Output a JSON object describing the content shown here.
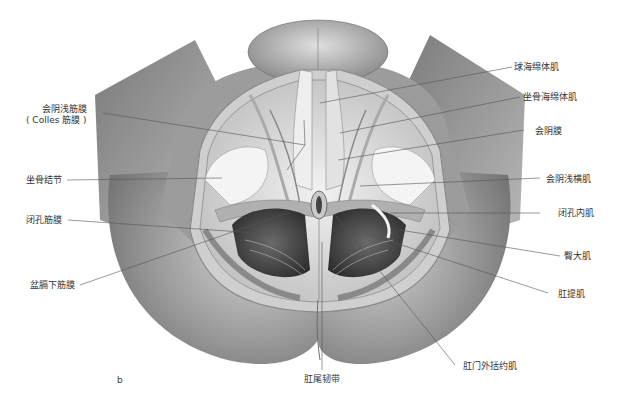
{
  "figure": {
    "panel_letter": "b"
  },
  "labels_left": [
    {
      "id": "superficial-perineal-fascia",
      "text": "会阴浅筋膜",
      "text2": "( Colles 筋膜 )"
    },
    {
      "id": "ischial-tuberosity",
      "text": "坐骨结节"
    },
    {
      "id": "obturator-fascia",
      "text": "闭孔筋膜"
    },
    {
      "id": "inferior-diaphragmatic-fascia",
      "text": "盆膈下筋膜"
    }
  ],
  "labels_right": [
    {
      "id": "bulbospongiosus",
      "text": "球海绵体肌"
    },
    {
      "id": "ischiocavernosus",
      "text": "坐骨海绵体肌"
    },
    {
      "id": "perineal-membrane",
      "text": "会阴膜"
    },
    {
      "id": "superficial-transverse-perineal",
      "text": "会阴浅横肌"
    },
    {
      "id": "obturator-internus",
      "text": "闭孔内肌"
    },
    {
      "id": "gluteus-maximus",
      "text": "臀大肌"
    },
    {
      "id": "levator-ani",
      "text": "肛提肌"
    },
    {
      "id": "external-anal-sphincter",
      "text": "肛门外括约肌"
    }
  ],
  "labels_bottom": [
    {
      "id": "anococcygeal-ligament",
      "text": "肛尾韧带"
    }
  ],
  "colors": {
    "skin": "#8e8e8e",
    "skin_light": "#c4c4c4",
    "tissue": "#e6e6e6",
    "leader_line": "#555555",
    "text": "#333333"
  }
}
